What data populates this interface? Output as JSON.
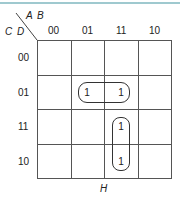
{
  "kmap": {
    "col_var_label": "A B",
    "row_var_label": "C D",
    "col_headers": [
      "00",
      "01",
      "11",
      "10"
    ],
    "row_headers": [
      "00",
      "01",
      "11",
      "10"
    ],
    "cells": [
      [
        "",
        "",
        "",
        ""
      ],
      [
        "",
        "1",
        "1",
        ""
      ],
      [
        "",
        "",
        "1",
        ""
      ],
      [
        "",
        "",
        "1",
        ""
      ]
    ],
    "groups": [
      {
        "name": "horizontal-pair",
        "row": "01",
        "cols": [
          "01",
          "11"
        ]
      },
      {
        "name": "vertical-pair",
        "col": "11",
        "rows": [
          "11",
          "10"
        ]
      }
    ],
    "caption": "H",
    "accent_color": "#9fc9cf"
  }
}
